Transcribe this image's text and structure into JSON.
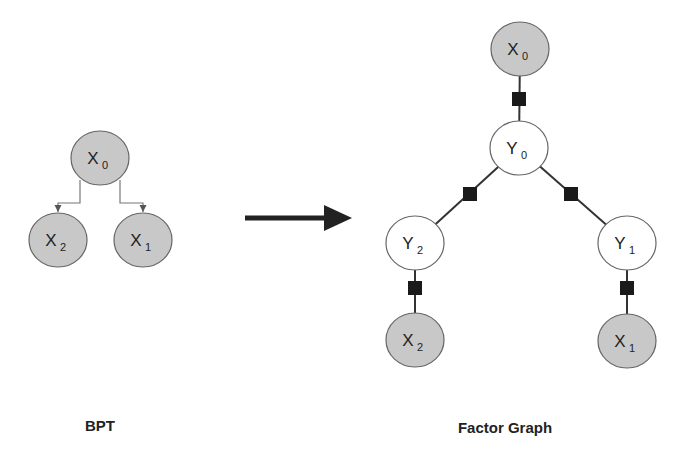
{
  "colors": {
    "observed_fill": "#c8c8c8",
    "hidden_fill": "#ffffff",
    "stroke": "#666666",
    "factor": "#1a1a1a",
    "edge": "#333333",
    "arrow": "#222222"
  },
  "bpt": {
    "caption": "BPT",
    "nodes": [
      {
        "id": "X0",
        "letter": "X",
        "sub": "0",
        "type": "observed",
        "cx": 100,
        "cy": 158
      },
      {
        "id": "X2",
        "letter": "X",
        "sub": "2",
        "type": "observed",
        "cx": 58,
        "cy": 240
      },
      {
        "id": "X1",
        "letter": "X",
        "sub": "1",
        "type": "observed",
        "cx": 143,
        "cy": 240
      }
    ],
    "edges": [
      {
        "from": "X0",
        "to": "X2"
      },
      {
        "from": "X0",
        "to": "X1"
      }
    ]
  },
  "transform_arrow": {
    "label": "transforms-to",
    "x1": 245,
    "y1": 218,
    "x2": 352,
    "y2": 218
  },
  "factor_graph": {
    "caption": "Factor Graph",
    "nodes": [
      {
        "id": "X0",
        "letter": "X",
        "sub": "0",
        "type": "observed",
        "cx": 520,
        "cy": 49
      },
      {
        "id": "Y0",
        "letter": "Y",
        "sub": "0",
        "type": "hidden",
        "cx": 519,
        "cy": 148
      },
      {
        "id": "Y2",
        "letter": "Y",
        "sub": "2",
        "type": "hidden",
        "cx": 415,
        "cy": 243
      },
      {
        "id": "Y1",
        "letter": "Y",
        "sub": "1",
        "type": "hidden",
        "cx": 627,
        "cy": 243
      },
      {
        "id": "X2",
        "letter": "X",
        "sub": "2",
        "type": "observed",
        "cx": 415,
        "cy": 340
      },
      {
        "id": "X1",
        "letter": "X",
        "sub": "1",
        "type": "observed",
        "cx": 627,
        "cy": 341
      }
    ],
    "factors": [
      {
        "between": [
          "X0",
          "Y0"
        ],
        "x": 519,
        "y": 99
      },
      {
        "between": [
          "Y0",
          "Y2"
        ],
        "x": 470,
        "y": 194
      },
      {
        "between": [
          "Y0",
          "Y1"
        ],
        "x": 571,
        "y": 194
      },
      {
        "between": [
          "Y2",
          "X2"
        ],
        "x": 415,
        "y": 288
      },
      {
        "between": [
          "Y1",
          "X1"
        ],
        "x": 627,
        "y": 288
      }
    ]
  }
}
